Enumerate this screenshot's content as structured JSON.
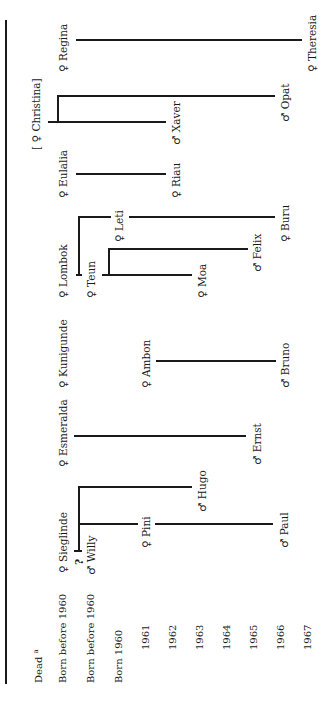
{
  "rows": {
    "dead": "Dead",
    "dead_note": "a",
    "born_before_1": "Born before 1960",
    "born_before_2": "Born before 1960",
    "born_1960": "Born 1960",
    "y1961": "1961",
    "y1962": "1962",
    "y1963": "1963",
    "y1964": "1964",
    "y1965": "1965",
    "y1966": "1966",
    "y1967": "1967"
  },
  "people": {
    "regina": "♀ Regina",
    "theresia": "♀ Theresia",
    "christina": "[ ♀ Christina]",
    "xaver": "♂ Xaver",
    "opat": "♂ Opat",
    "eulalia": "♀ Eulalia",
    "riau": "♀ Riau",
    "lombok": "♀ Lombok",
    "teun": "♀ Teun",
    "leti": "♀ Leti",
    "moa": "♀ Moa",
    "felix": "♂ Felix",
    "buru": "♀ Buru",
    "kunigunde": "♀ Kunigunde",
    "ambon": "♀ Ambon",
    "bruno": "♂ Bruno",
    "esmeralda": "♀ Esmeralda",
    "ernst": "♂ Ernst",
    "sieglinde": "♀ Sieglinde",
    "question": "?",
    "willy": "♂ Willy",
    "pini": "♀ Pini",
    "hugo": "♂ Hugo",
    "paul": "♂ Paul"
  }
}
